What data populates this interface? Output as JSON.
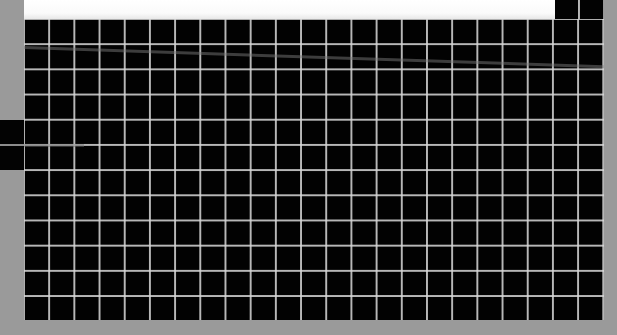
{
  "image": {
    "description": "Photograph of a black panel with a white grid of square cells",
    "background_color": "#9a9a9a",
    "panel_color": "#020202",
    "grid_line_color": "#d7d7d7",
    "top_band_color": "#ffffff",
    "grid": {
      "columns": 23,
      "rows": 12,
      "cell_size_px": 25
    }
  }
}
